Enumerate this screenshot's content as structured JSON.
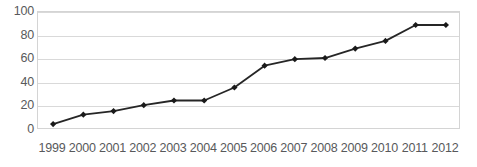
{
  "chart_data": {
    "type": "line",
    "title": "",
    "subtitle": "",
    "xlabel": "",
    "ylabel": "",
    "categories": [
      "1999",
      "2000",
      "2001",
      "2002",
      "2003",
      "2004",
      "2005",
      "2006",
      "2007",
      "2008",
      "2009",
      "2010",
      "2011",
      "2012"
    ],
    "values": [
      5,
      13,
      16,
      21,
      25,
      25,
      36,
      54.5,
      60,
      61,
      69,
      75.5,
      89,
      89
    ],
    "series": [
      {
        "name": "",
        "values": [
          5,
          13,
          16,
          21,
          25,
          25,
          36,
          54.5,
          60,
          61,
          69,
          75.5,
          89,
          89
        ]
      }
    ],
    "ylim": [
      0,
      100
    ],
    "y_ticks": [
      0,
      20,
      40,
      60,
      80,
      100
    ],
    "y_tick_labels": [
      "0",
      "20",
      "40",
      "60",
      "80",
      "100"
    ],
    "x_tick_labels": [
      "1999",
      "2000",
      "2001",
      "2002",
      "2003",
      "2004",
      "2005",
      "2006",
      "2007",
      "2008",
      "2009",
      "2010",
      "2011",
      "2012"
    ],
    "grid": true,
    "grid_axis": "y",
    "legend": false,
    "legend_position": "none",
    "marker": "diamond",
    "annotations": [],
    "colors": {
      "line": "#262626",
      "marker": "#1a1a1a",
      "grid": "#d9d9d9",
      "plot_border": "#d4d4d4",
      "tick_label": "#58595b",
      "background": "#ffffff"
    }
  }
}
